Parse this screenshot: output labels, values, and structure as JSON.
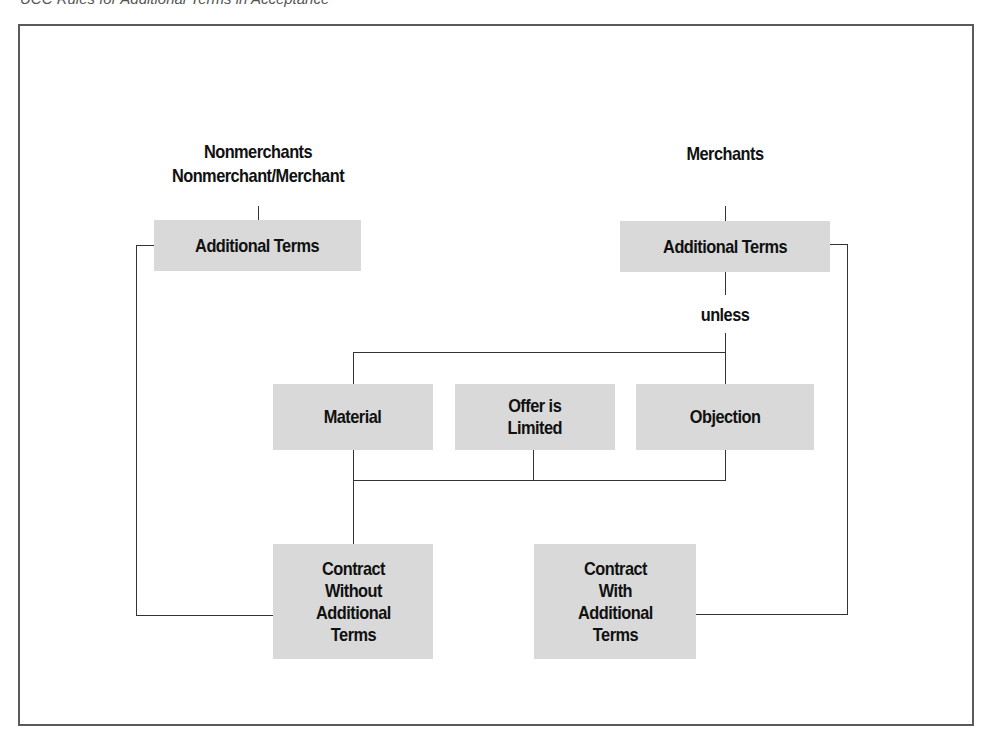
{
  "caption": "UCC Rules for Additional Terms in Acceptance",
  "headers": {
    "left_line1": "Nonmerchants",
    "left_line2": "Nonmerchant/Merchant",
    "right": "Merchants"
  },
  "boxes": {
    "left_additional_terms": "Additional Terms",
    "right_additional_terms": "Additional Terms",
    "material": "Material",
    "offer_limited": "Offer is\nLimited",
    "objection": "Objection",
    "contract_without": "Contract\nWithout\nAdditional\nTerms",
    "contract_with": "Contract\nWith\nAdditional\nTerms"
  },
  "connector_label": "unless",
  "colors": {
    "box_fill": "#d9d9d9",
    "line": "#333333",
    "frame": "#5a5a5a"
  }
}
